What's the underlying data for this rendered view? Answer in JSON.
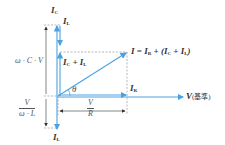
{
  "diagram": {
    "title": "",
    "colors": {
      "vector": "#4aa3df",
      "dimension": "#333333",
      "dashed": "#888888"
    },
    "labels": {
      "ic_top": "I",
      "ic_top_sub": "C",
      "il_top": "I",
      "il_top_sub": "L",
      "ic_plus_il": "I",
      "ic_plus_il_sub1": "C",
      "ic_plus_il_plus": " + I",
      "ic_plus_il_sub2": "L",
      "i_total": "I = I",
      "i_total_sub_r": "R",
      "i_total_mid": " + (I",
      "i_total_sub_c": "C",
      "i_total_plus": " + I",
      "i_total_sub_l": "L",
      "i_total_close": ")",
      "theta": "θ",
      "ir": "I",
      "ir_sub": "R",
      "v_ref": "V",
      "v_ref_note": "(基準)",
      "il_bottom": "I",
      "il_bottom_sub": "L",
      "omega_c_v": "ω · C · V",
      "v_over_wl_num": "V",
      "v_over_wl_den": "ω · L",
      "v_over_r_num": "V",
      "v_over_r_den": "R"
    }
  }
}
